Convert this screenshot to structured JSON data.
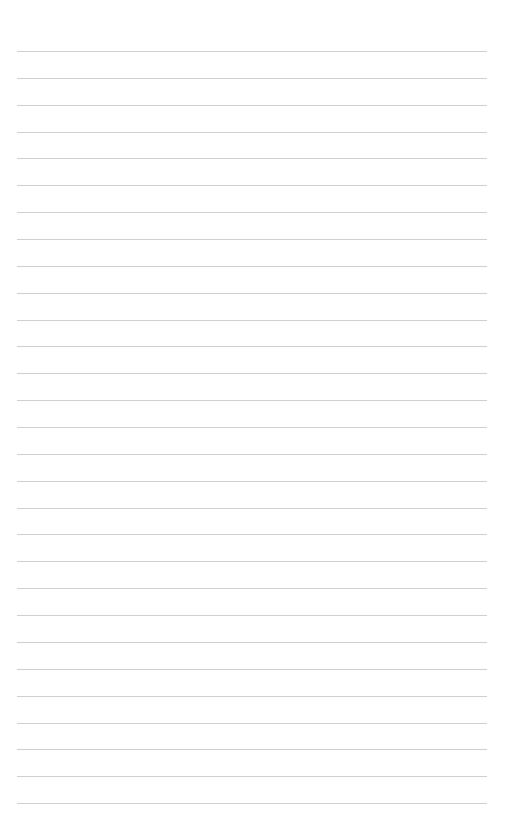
{
  "page": {
    "type": "lined-paper",
    "line_count": 29,
    "first_line_y": 51,
    "line_spacing": 26.86,
    "line_left": 17,
    "line_right": 487,
    "line_color": "#cfcfcf",
    "background": "#ffffff"
  }
}
